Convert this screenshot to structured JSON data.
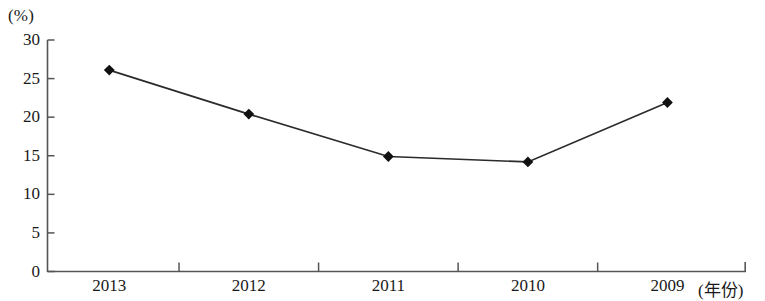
{
  "chart_data": {
    "type": "line",
    "title": "",
    "subtitle": "",
    "xlabel": "(年份)",
    "ylabel": "(%)",
    "categories": [
      "2013",
      "2012",
      "2011",
      "2010",
      "2009"
    ],
    "values": [
      26.1,
      20.4,
      14.9,
      14.2,
      21.9
    ],
    "series": [
      {
        "name": "",
        "values": [
          26.1,
          20.4,
          14.9,
          14.2,
          21.9
        ]
      }
    ],
    "ylim": [
      0,
      30
    ],
    "yticks": [
      0,
      5,
      10,
      15,
      20,
      25,
      30
    ],
    "ytick_labels": [
      "0",
      "5",
      "10",
      "15",
      "20",
      "25",
      "30"
    ],
    "xtick_labels": [
      "2013",
      "2012",
      "2011",
      "2010",
      "2009"
    ],
    "grid": false,
    "legend": false,
    "legend_position": "none",
    "marker": "diamond",
    "line_color": "#2b2b2b",
    "marker_color": "#111111",
    "axis_color": "#555555",
    "background_color": "#ffffff"
  },
  "axes": {
    "y_unit_label": "(%)",
    "x_axis_title": "(年份)"
  }
}
